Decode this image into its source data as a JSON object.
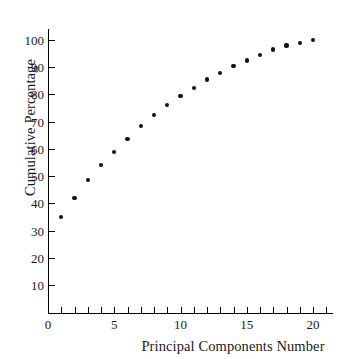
{
  "chart_data": {
    "type": "scatter",
    "title": "",
    "xlabel": "Principal Components Number",
    "ylabel": "Cumulative Percentage",
    "x": [
      1,
      2,
      3,
      4,
      5,
      6,
      7,
      8,
      9,
      10,
      11,
      12,
      13,
      14,
      15,
      16,
      17,
      18,
      19,
      20
    ],
    "values": [
      35,
      42,
      48.5,
      54,
      59,
      63.5,
      68.5,
      72.5,
      76,
      79.5,
      82.5,
      85.5,
      88,
      90.5,
      92.5,
      94.5,
      96.5,
      98,
      99,
      100
    ],
    "series": [
      {
        "name": "Cumulative Percentage",
        "values": [
          35,
          42,
          48.5,
          54,
          59,
          63.5,
          68.5,
          72.5,
          76,
          79.5,
          82.5,
          85.5,
          88,
          90.5,
          92.5,
          94.5,
          96.5,
          98,
          99,
          100
        ]
      }
    ],
    "xlim": [
      0,
      21.5
    ],
    "ylim": [
      0,
      103
    ],
    "x_tick_labels": [
      "0",
      "5",
      "10",
      "15",
      "20"
    ],
    "x_tick_values": [
      0,
      5,
      10,
      15,
      20
    ],
    "x_minor_ticks": [
      1,
      2,
      3,
      4,
      5,
      6,
      7,
      8,
      9,
      10,
      11,
      12,
      13,
      14,
      15,
      16,
      17,
      18,
      19,
      20,
      21
    ],
    "y_tick_labels": [
      "10",
      "20",
      "30",
      "40",
      "50",
      "60",
      "70",
      "80",
      "90",
      "100"
    ],
    "y_tick_values": [
      10,
      20,
      30,
      40,
      50,
      60,
      70,
      80,
      90,
      100
    ],
    "grid": false,
    "legend": false,
    "marker_color": "#111111",
    "axis_color": "#000000",
    "background_color": "#ffffff"
  }
}
